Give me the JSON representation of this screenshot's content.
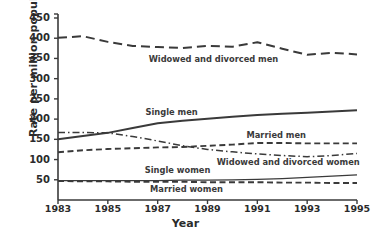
{
  "chart_data": {
    "type": "line",
    "title": "",
    "xlabel": "Year",
    "ylabel": "Rate per million population",
    "x": [
      1983,
      1984,
      1985,
      1986,
      1987,
      1988,
      1989,
      1990,
      1991,
      1992,
      1993,
      1994,
      1995
    ],
    "xlim": [
      1983,
      1995
    ],
    "ylim": [
      0,
      450
    ],
    "yticks": [
      50,
      100,
      150,
      200,
      250,
      300,
      350,
      400,
      450
    ],
    "xticks": [
      1983,
      1985,
      1987,
      1989,
      1991,
      1993,
      1995
    ],
    "grid": false,
    "legend": "inline-annotations",
    "series": [
      {
        "name": "Widowed and divorced men",
        "style": "long-dash",
        "values": [
          401,
          405,
          391,
          381,
          378,
          376,
          381,
          379,
          390,
          374,
          359,
          364,
          360
        ]
      },
      {
        "name": "Single men",
        "style": "solid",
        "values": [
          150,
          158,
          166,
          178,
          190,
          196,
          201,
          206,
          210,
          213,
          216,
          219,
          222
        ]
      },
      {
        "name": "Married men",
        "style": "dash",
        "values": [
          118,
          123,
          126,
          128,
          130,
          131,
          134,
          137,
          141,
          141,
          140,
          140,
          140
        ]
      },
      {
        "name": "Widowed and divorced women",
        "style": "dash-dot",
        "values": [
          167,
          167,
          166,
          157,
          146,
          134,
          125,
          119,
          114,
          110,
          107,
          110,
          115
        ]
      },
      {
        "name": "Single women",
        "style": "thin-solid",
        "values": [
          48,
          48,
          48,
          48,
          48,
          49,
          49,
          50,
          51,
          53,
          56,
          59,
          62
        ]
      },
      {
        "name": "Married women",
        "style": "dash",
        "values": [
          47,
          46,
          46,
          45,
          45,
          45,
          44,
          44,
          44,
          43,
          43,
          42,
          42
        ]
      }
    ],
    "annotations": [
      {
        "text": "Widowed and divorced men",
        "x_pct": 52,
        "y_val": 345
      },
      {
        "text": "Single men",
        "x_pct": 38,
        "y_val": 214
      },
      {
        "text": "Married men",
        "x_pct": 73,
        "y_val": 158
      },
      {
        "text": "Widowed and divorced women",
        "x_pct": 77,
        "y_val": 92
      },
      {
        "text": "Single women",
        "x_pct": 40,
        "y_val": 72
      },
      {
        "text": "Married women",
        "x_pct": 43,
        "y_val": 24
      }
    ],
    "axis_color": "#3a3a3a",
    "line_color": "#3a3a3a"
  }
}
